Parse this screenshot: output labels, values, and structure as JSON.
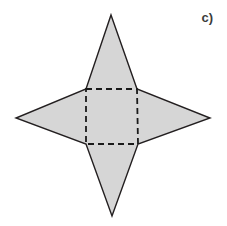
{
  "figure": {
    "label": "c)",
    "caption_label": "c)",
    "background_color": "#ffffff",
    "fill_color": "#d6d6d6",
    "outline_color": "#231f20",
    "dash_color": "#1a1a1a",
    "outline_width": 1.4,
    "dash_width": 1.8,
    "dash_pattern": "6 4",
    "width": 227,
    "height": 226
  },
  "chart_data": {
    "type": "scatter",
    "title": "c)",
    "xlabel": "",
    "ylabel": "",
    "xlim": [
      0,
      227
    ],
    "ylim": [
      226,
      0
    ],
    "grid": false,
    "legend": "none",
    "annotations": [
      "c)"
    ],
    "shapes": {
      "star_outline_points": "111,15 137,89 210,118 138,144 112,216 86,144 16,118 86,89",
      "center_square_points": "86,89 137,89 138,144 86,144",
      "vertices": {
        "top_apex": [
          111,
          15
        ],
        "right_apex": [
          210,
          118
        ],
        "bottom_apex": [
          112,
          216
        ],
        "left_apex": [
          16,
          118
        ],
        "square_top_left": [
          86,
          89
        ],
        "square_top_right": [
          137,
          89
        ],
        "square_bottom_right": [
          138,
          144
        ],
        "square_bottom_left": [
          86,
          144
        ]
      }
    }
  }
}
